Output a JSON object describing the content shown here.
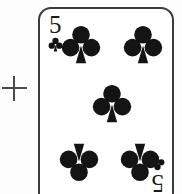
{
  "scene": {
    "background_color": "#fdfdfd",
    "description": "Scanned playing card with registration crosshair"
  },
  "marker": {
    "name": "plus",
    "symbol": "+",
    "color": "#4a4a4a"
  },
  "card": {
    "rank": "5",
    "suit": "clubs",
    "suit_symbol": "♣",
    "label": "5 of Clubs",
    "face_color": "#ffffff",
    "ink_color": "#1a1a1a",
    "border_color": "#3b3b3b",
    "indices": [
      {
        "position": "top-left",
        "rank": "5",
        "suit_symbol": "♣",
        "rotated": false
      },
      {
        "position": "bottom-right",
        "rank": "5",
        "suit_symbol": "♣",
        "rotated": true
      }
    ],
    "pips": [
      {
        "position": "top-left",
        "suit_symbol": "♣",
        "inverted": false
      },
      {
        "position": "top-right",
        "suit_symbol": "♣",
        "inverted": false
      },
      {
        "position": "center",
        "suit_symbol": "♣",
        "inverted": false
      },
      {
        "position": "bottom-left",
        "suit_symbol": "♣",
        "inverted": true
      },
      {
        "position": "bottom-right",
        "suit_symbol": "♣",
        "inverted": true
      }
    ],
    "pip_count": 5
  }
}
